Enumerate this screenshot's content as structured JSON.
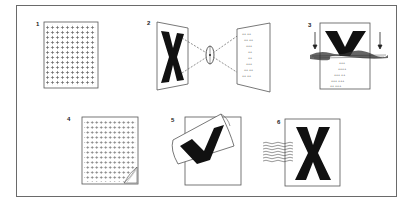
{
  "figure": {
    "panels": [
      {
        "number": "1",
        "label": "grid-sheet"
      },
      {
        "number": "2",
        "label": "lens-projection"
      },
      {
        "number": "3",
        "label": "coating-application"
      },
      {
        "number": "4",
        "label": "peeling-grid-sheet"
      },
      {
        "number": "5",
        "label": "film-transfer"
      },
      {
        "number": "6",
        "label": "final-print"
      }
    ]
  }
}
